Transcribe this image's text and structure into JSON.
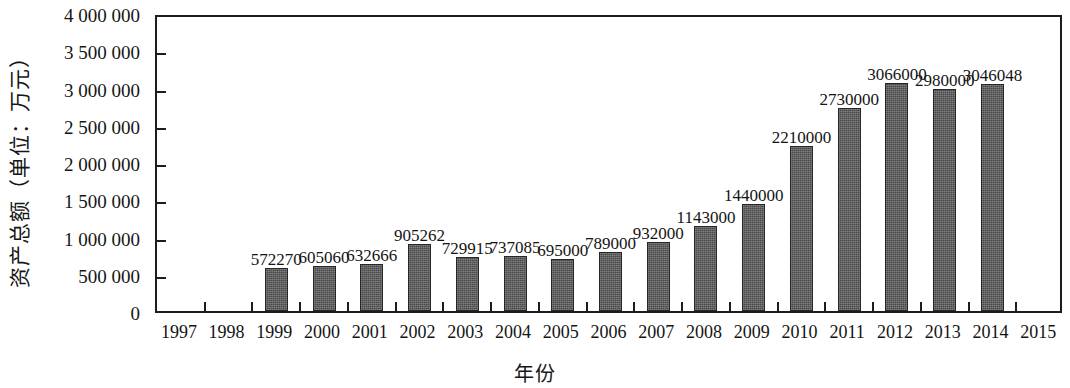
{
  "chart_data": {
    "type": "bar",
    "title": "",
    "xlabel": "年份",
    "ylabel": "资产总额（单位：万元）",
    "categories": [
      "1997",
      "1998",
      "1999",
      "2000",
      "2001",
      "2002",
      "2003",
      "2004",
      "2005",
      "2006",
      "2007",
      "2008",
      "2009",
      "2010",
      "2011",
      "2012",
      "2013",
      "2014",
      "2015"
    ],
    "values": [
      null,
      null,
      572270,
      605060,
      632666,
      905262,
      729915,
      737085,
      695000,
      789000,
      932000,
      1143000,
      1440000,
      2210000,
      2730000,
      3066000,
      2980000,
      3046048,
      null
    ],
    "value_labels": [
      "",
      "",
      "572270",
      "605060",
      "632666",
      "905262",
      "729915",
      "737085",
      "695000",
      "789000",
      "932000",
      "1143000",
      "1440000",
      "2210000",
      "2730000",
      "3066000",
      "2980000",
      "3046048",
      ""
    ],
    "ylim": [
      0,
      4000000
    ],
    "ytick_values": [
      4000000,
      3500000,
      3000000,
      2500000,
      2000000,
      1500000,
      1000000,
      500000,
      0
    ],
    "ytick_labels": [
      "4 000 000",
      "3 500 000",
      "3 000 000",
      "2 500 000",
      "2 000 000",
      "1 500 000",
      "1 000 000",
      "500 000",
      "0"
    ],
    "grid": false,
    "legend": null,
    "bar_color": "#5a5a5a",
    "axis_color": "#1d1d1d"
  }
}
